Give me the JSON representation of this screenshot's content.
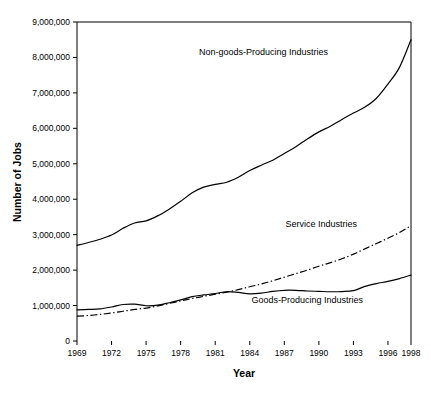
{
  "chart_data": {
    "type": "line",
    "title": "",
    "xlabel": "Year",
    "ylabel": "Number of Jobs",
    "xlim": [
      1969,
      1998
    ],
    "ylim": [
      0,
      9000000
    ],
    "grid": false,
    "legend_position": "inline-annotations",
    "x_tick_labels": [
      "1969",
      "1972",
      "1975",
      "1978",
      "1981",
      "1984",
      "1987",
      "1990",
      "1993",
      "1996",
      "1998"
    ],
    "x_tick_values": [
      1969,
      1972,
      1975,
      1978,
      1981,
      1984,
      1987,
      1990,
      1993,
      1996,
      1998
    ],
    "y_tick_labels": [
      "0",
      "1,000,000",
      "2,000,000",
      "3,000,000",
      "4,000,000",
      "5,000,000",
      "6,000,000",
      "7,000,000",
      "8,000,000",
      "9,000,000"
    ],
    "y_tick_values": [
      0,
      1000000,
      2000000,
      3000000,
      4000000,
      5000000,
      6000000,
      7000000,
      8000000,
      9000000
    ],
    "x": [
      1969,
      1970,
      1971,
      1972,
      1973,
      1974,
      1975,
      1976,
      1977,
      1978,
      1979,
      1980,
      1981,
      1982,
      1983,
      1984,
      1985,
      1986,
      1987,
      1988,
      1989,
      1990,
      1991,
      1992,
      1993,
      1994,
      1995,
      1996,
      1997,
      1998
    ],
    "series": [
      {
        "name": "Non-goods-Producing Industries",
        "style": "solid",
        "values": [
          2700000,
          2780000,
          2870000,
          2990000,
          3180000,
          3330000,
          3390000,
          3530000,
          3720000,
          3940000,
          4180000,
          4340000,
          4420000,
          4480000,
          4620000,
          4810000,
          4960000,
          5100000,
          5290000,
          5480000,
          5700000,
          5900000,
          6060000,
          6250000,
          6430000,
          6600000,
          6850000,
          7250000,
          7720000,
          8500000
        ]
      },
      {
        "name": "Service Industries",
        "style": "dash-dot",
        "values": [
          700000,
          720000,
          750000,
          790000,
          840000,
          890000,
          930000,
          990000,
          1060000,
          1130000,
          1200000,
          1260000,
          1320000,
          1380000,
          1450000,
          1530000,
          1610000,
          1700000,
          1800000,
          1900000,
          2000000,
          2110000,
          2210000,
          2320000,
          2450000,
          2600000,
          2750000,
          2900000,
          3060000,
          3250000
        ]
      },
      {
        "name": "Goods-Producing Industries",
        "style": "solid",
        "values": [
          880000,
          890000,
          905000,
          960000,
          1030000,
          1040000,
          995000,
          1010000,
          1080000,
          1160000,
          1250000,
          1300000,
          1340000,
          1390000,
          1370000,
          1330000,
          1350000,
          1400000,
          1430000,
          1430000,
          1410000,
          1400000,
          1390000,
          1395000,
          1420000,
          1540000,
          1620000,
          1680000,
          1760000,
          1860000
        ]
      }
    ],
    "annotations": [
      {
        "text": "Non-goods-Producing Industries",
        "x": 1985.2,
        "y": 8060000
      },
      {
        "text": "Service Industries",
        "x": 1990.2,
        "y": 3220000
      },
      {
        "text": "Goods-Producing Industries",
        "x": 1989.0,
        "y": 1060000
      }
    ]
  }
}
